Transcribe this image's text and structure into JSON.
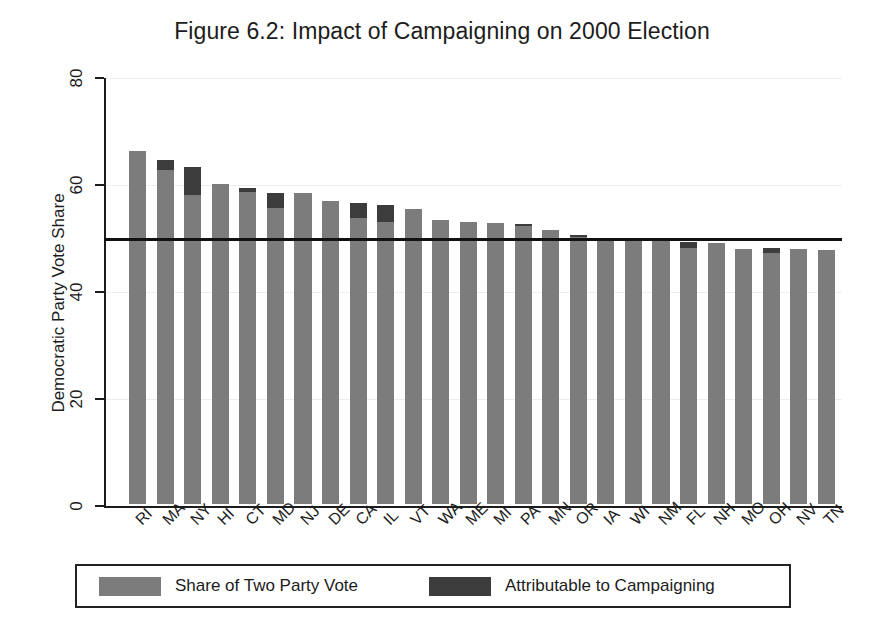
{
  "chart_data": {
    "type": "bar",
    "title": "Figure 6.2: Impact of Campaigning on 2000 Election",
    "xlabel": "",
    "ylabel": "Democratic Party Vote Share",
    "ylim": [
      0,
      80
    ],
    "yticks": [
      0,
      20,
      40,
      60,
      80
    ],
    "grid": true,
    "stacked": true,
    "legend_position": "bottom",
    "reference_line": {
      "value": 50,
      "label": "50% two-party vote"
    },
    "categories": [
      "RI",
      "MA",
      "NY",
      "HI",
      "CT",
      "MD",
      "NJ",
      "DE",
      "CA",
      "IL",
      "VT",
      "WA",
      "ME",
      "MI",
      "PA",
      "MN",
      "OR",
      "IA",
      "WI",
      "NM",
      "FL",
      "NH",
      "MO",
      "OH",
      "NV",
      "TN"
    ],
    "series": [
      {
        "name": "Share of Two Party Vote",
        "color": "#7c7c7c",
        "values": [
          66.0,
          62.5,
          57.8,
          59.8,
          58.3,
          55.4,
          58.2,
          56.7,
          53.5,
          52.8,
          55.2,
          53.0,
          52.7,
          52.6,
          51.9,
          51.3,
          49.9,
          49.7,
          49.7,
          49.6,
          47.9,
          48.7,
          47.7,
          46.9,
          47.6,
          47.4
        ]
      },
      {
        "name": "Attributable to Campaigning",
        "color": "#3c3c3c",
        "values": [
          0.0,
          1.8,
          5.2,
          0.0,
          0.8,
          2.8,
          0.0,
          0.0,
          2.8,
          3.0,
          0.0,
          0.0,
          0.0,
          0.0,
          0.4,
          0.0,
          0.3,
          0.0,
          0.0,
          0.0,
          1.0,
          0.0,
          0.0,
          1.0,
          0.0,
          0.0
        ]
      }
    ],
    "totals": [
      66.0,
      64.3,
      63.0,
      59.8,
      59.1,
      58.2,
      58.2,
      56.7,
      56.3,
      55.8,
      55.2,
      53.0,
      52.7,
      52.6,
      52.3,
      51.3,
      50.2,
      49.7,
      49.7,
      49.6,
      48.9,
      48.7,
      47.7,
      47.9,
      47.6,
      47.4
    ]
  },
  "legend": {
    "entries": [
      {
        "label": "Share of Two Party Vote",
        "color": "#7c7c7c"
      },
      {
        "label": "Attributable to Campaigning",
        "color": "#3c3c3c"
      }
    ]
  }
}
